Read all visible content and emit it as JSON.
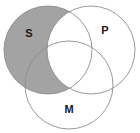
{
  "figure": {
    "type": "venn-diagram",
    "width": 140,
    "height": 133,
    "background_color": "#ffffff"
  },
  "style": {
    "shade_color": "#a3a3a3",
    "stroke_color": "#8c8c8c",
    "stroke_width": 0.9,
    "label_color": "#1a1a1a",
    "label_font_size": 11
  },
  "circles": [
    {
      "id": "S",
      "label": "S",
      "position": "top-left",
      "cx": 48,
      "cy": 50,
      "r": 44,
      "fill": "shaded",
      "fill_color": "#a3a3a3",
      "label_x": 29,
      "label_y": 34
    },
    {
      "id": "P",
      "label": "P",
      "position": "top-right",
      "cx": 91,
      "cy": 50,
      "r": 44,
      "fill": "unshaded",
      "fill_color": "#ffffff",
      "label_x": 105,
      "label_y": 31
    },
    {
      "id": "M",
      "label": "M",
      "position": "bottom-center",
      "cx": 69,
      "cy": 85,
      "r": 44,
      "fill": "unshaded",
      "fill_color": "#ffffff",
      "label_x": 69,
      "label_y": 110
    }
  ],
  "shading": {
    "description": "The S circle is shaded gray everywhere except the region it shares with P; the S-and-P overlap region is left white.",
    "shaded_regions": [
      "S-only",
      "S-and-M-not-P"
    ],
    "unshaded_regions": [
      "S-and-P",
      "S-and-P-and-M",
      "P-only",
      "M-only",
      "P-and-M",
      "outside"
    ]
  },
  "labels": {
    "s": "S",
    "p": "P",
    "m": "M"
  }
}
